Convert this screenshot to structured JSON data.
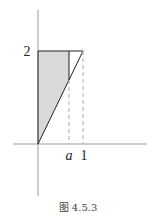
{
  "figure": {
    "caption": "图 4.5.3",
    "labels": {
      "y_tick": "2",
      "x_tick_a": "a",
      "x_tick_1": "1"
    },
    "colors": {
      "axis": "#999999",
      "line": "#222222",
      "fill": "#d9d9d9",
      "dashed": "#aaaaaa"
    }
  }
}
